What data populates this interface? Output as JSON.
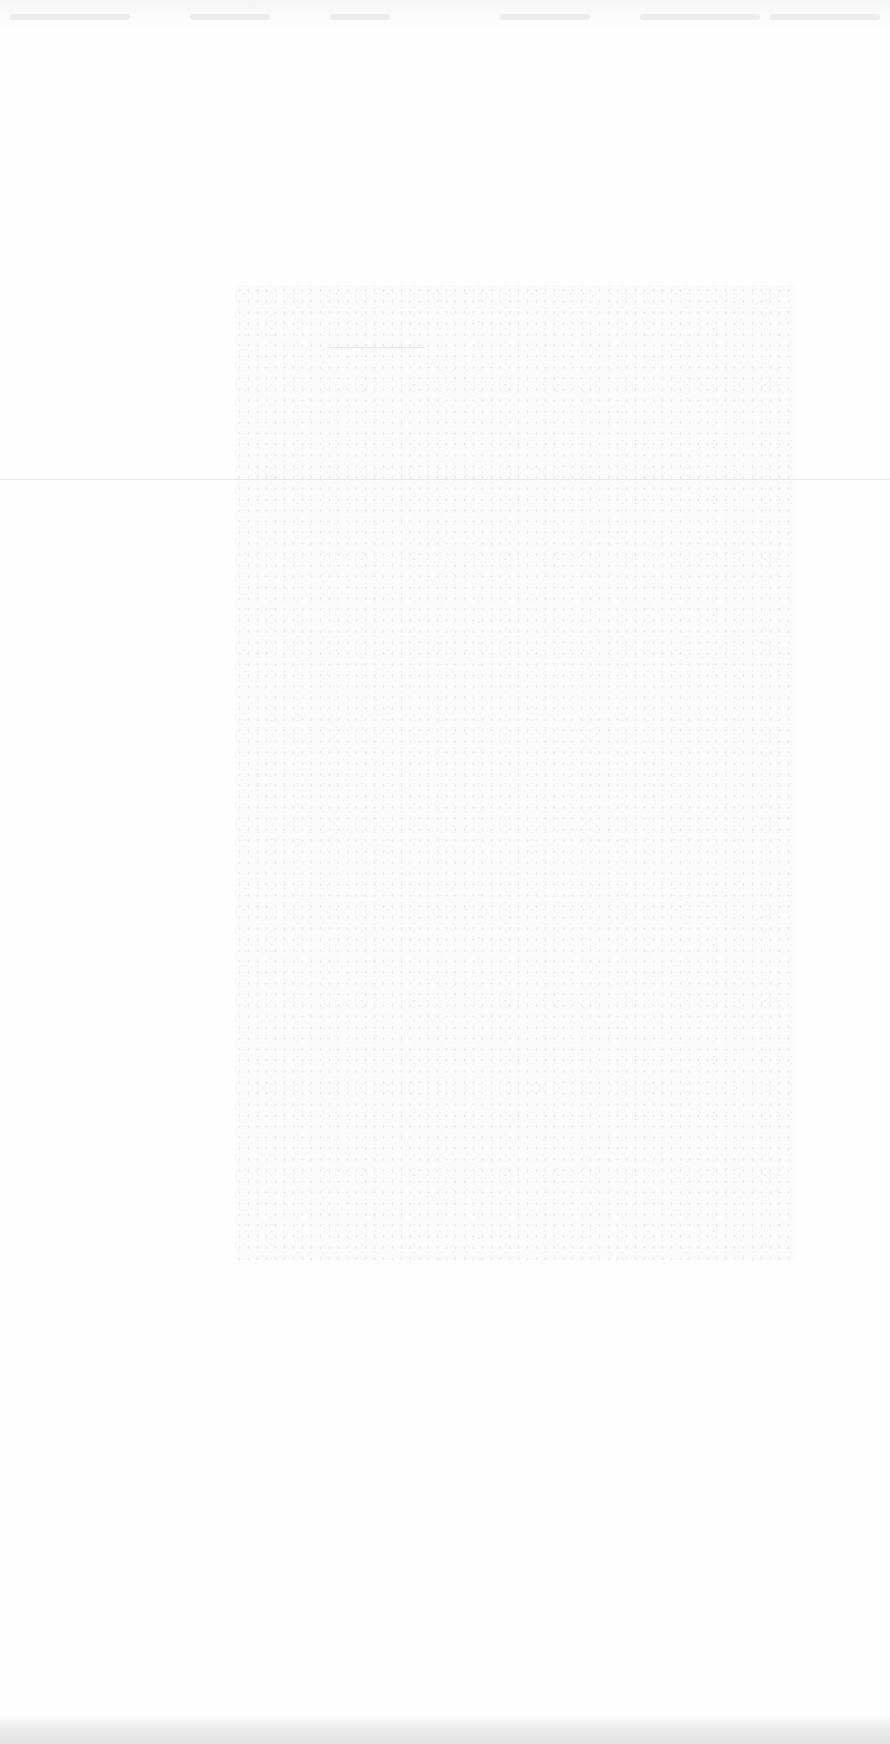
{
  "page": {
    "background_color": "#fefefe",
    "artifact_color": "#e2e2e2"
  }
}
